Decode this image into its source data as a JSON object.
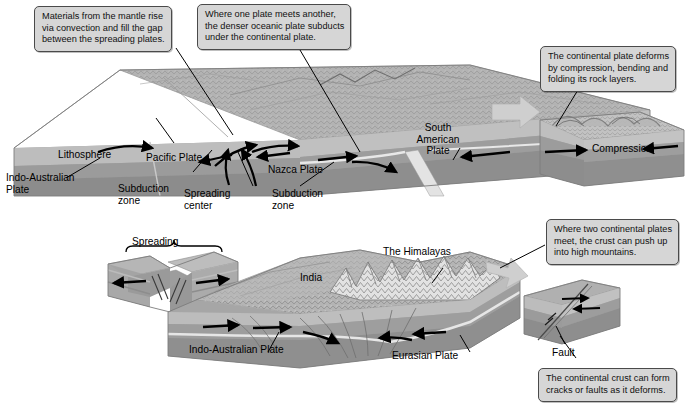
{
  "figure": {
    "style": {
      "callout_fill": "#d6d6d6",
      "callout_border": "#4a4a4a",
      "ink": "#000000"
    }
  },
  "callouts": [
    {
      "id": "mantle-convection",
      "lines": [
        "Materials from the mantle rise",
        "via convection and fill the gap",
        "between the spreading plates."
      ]
    },
    {
      "id": "subduction",
      "lines": [
        "Where one plate meets another,",
        "the denser oceanic plate subducts",
        "under the continental plate."
      ]
    },
    {
      "id": "compression-deform",
      "lines": [
        "The continental plate deforms",
        "by compression, bending and",
        "folding its rock layers."
      ]
    },
    {
      "id": "mountains",
      "lines": [
        "Where two continental plates",
        "meet, the crust can push up",
        "into high mountains."
      ]
    },
    {
      "id": "faults",
      "lines": [
        "The continental crust can form",
        "cracks or faults as it deforms."
      ]
    }
  ],
  "labels": {
    "lithosphere": "Lithosphere",
    "indo_australian_plate_top": [
      "Indo-Australian",
      "Plate"
    ],
    "subduction_zone_left": [
      "Subduction",
      "zone"
    ],
    "spreading_center": [
      "Spreading",
      "center"
    ],
    "pacific_plate": "Pacific Plate",
    "nazca_plate": "Nazca Plate",
    "subduction_zone_right": [
      "Subduction",
      "zone"
    ],
    "south_american_plate": [
      "South",
      "American",
      "Plate"
    ],
    "compression": "Compression",
    "spreading": "Spreading",
    "india": "India",
    "the_himalayas": "The Himalayas",
    "indo_australian_plate_bottom": "Indo-Australian Plate",
    "eurasian_plate": "Eurasian Plate",
    "fault": "Fault"
  },
  "blocks": [
    {
      "id": "ocean-trench-block",
      "caption": "Pacific / Nazca / South American plate block"
    },
    {
      "id": "compression-block",
      "caption": "Compression block"
    },
    {
      "id": "spreading-block",
      "caption": "Spreading ridge block"
    },
    {
      "id": "himalaya-block",
      "caption": "India / Eurasia collision block"
    },
    {
      "id": "fault-block",
      "caption": "Fault block"
    }
  ]
}
